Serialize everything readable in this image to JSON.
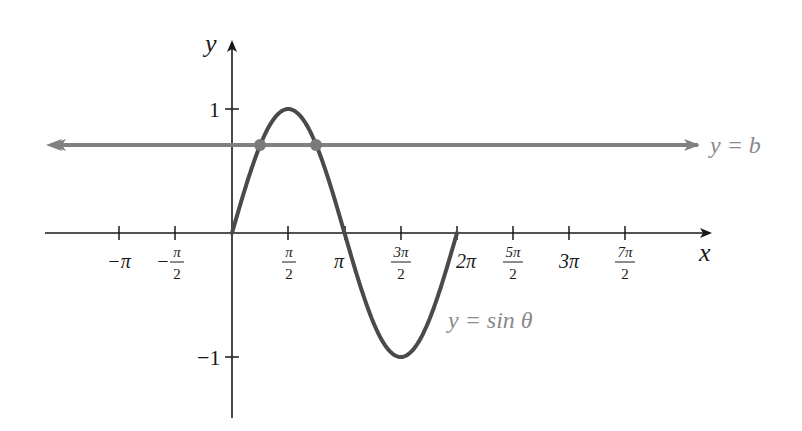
{
  "figure": {
    "axis_labels": {
      "x": "x",
      "y": "y"
    },
    "y_ticks": [
      {
        "value": 1,
        "label": "1"
      },
      {
        "value": -1,
        "label": "−1"
      }
    ],
    "x_ticks": [
      {
        "value": "-pi",
        "num": "−π",
        "den": ""
      },
      {
        "value": "-pi/2",
        "num": "π",
        "den": "2",
        "sign": "−"
      },
      {
        "value": "pi/2",
        "num": "π",
        "den": "2"
      },
      {
        "value": "pi",
        "num": "π",
        "den": ""
      },
      {
        "value": "3pi/2",
        "num": "3π",
        "den": "2"
      },
      {
        "value": "2pi",
        "num": "2π",
        "den": ""
      },
      {
        "value": "5pi/2",
        "num": "5π",
        "den": "2"
      },
      {
        "value": "3pi",
        "num": "3π",
        "den": ""
      },
      {
        "value": "7pi/2",
        "num": "7π",
        "den": "2"
      }
    ],
    "curve_label": "y = sin θ",
    "line_label": "y = b",
    "colors": {
      "axis": "#1a1a1a",
      "curve": "#4a4a4a",
      "line": "#808080",
      "points": "#7a7a7a",
      "label_grey": "#8a8a8a"
    }
  },
  "chart_data": {
    "type": "line",
    "title": "",
    "xlabel": "x",
    "ylabel": "y",
    "xlim": [
      -3.93,
      11.9
    ],
    "ylim": [
      -1.5,
      1.5
    ],
    "grid": false,
    "series": [
      {
        "name": "y = sin θ",
        "domain": [
          0,
          6.2832
        ],
        "x": [
          0,
          0.7854,
          1.5708,
          2.3562,
          3.1416,
          3.927,
          4.7124,
          5.4978,
          6.2832
        ],
        "values": [
          0,
          0.707,
          1,
          0.707,
          0,
          -0.707,
          -1,
          -0.707,
          0
        ]
      },
      {
        "name": "y = b",
        "type": "horizontal-line",
        "value": 0.71
      }
    ],
    "points": [
      {
        "x": 0.79,
        "y": 0.71
      },
      {
        "x": 2.36,
        "y": 0.71
      }
    ],
    "x_tick_labels": [
      "−π",
      "−π/2",
      "π/2",
      "π",
      "3π/2",
      "2π",
      "5π/2",
      "3π",
      "7π/2"
    ],
    "y_tick_labels": [
      "1",
      "−1"
    ],
    "annotations": [
      "y = sin θ",
      "y = b"
    ]
  }
}
